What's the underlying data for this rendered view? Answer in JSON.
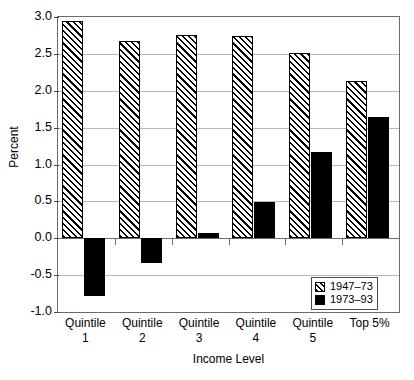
{
  "chart_data": {
    "type": "bar",
    "title": "",
    "xlabel": "Income Level",
    "ylabel": "Percent",
    "categories": [
      "Quintile 1",
      "Quintile 2",
      "Quintile 3",
      "Quintile 4",
      "Quintile 5",
      "Top 5%"
    ],
    "category_lines": [
      [
        "Quintile",
        "1"
      ],
      [
        "Quintile",
        "2"
      ],
      [
        "Quintile",
        "3"
      ],
      [
        "Quintile",
        "4"
      ],
      [
        "Quintile",
        "5"
      ],
      [
        "Top 5%",
        ""
      ]
    ],
    "series": [
      {
        "name": "1947–73",
        "style": "hatched",
        "values": [
          2.95,
          2.67,
          2.76,
          2.74,
          2.51,
          2.13
        ]
      },
      {
        "name": "1973–93",
        "style": "solid",
        "values": [
          -0.78,
          -0.34,
          0.07,
          0.49,
          1.17,
          1.65
        ]
      }
    ],
    "ylim": [
      -1.0,
      3.0
    ],
    "yticks": [
      3.0,
      2.5,
      2.0,
      1.5,
      1.0,
      0.5,
      0.0,
      -0.5,
      -1.0
    ],
    "ytick_labels": [
      "3.0",
      "2.5",
      "2.0",
      "1.5",
      "1.0",
      "0.5",
      "0.0",
      "-0.5",
      "-1.0"
    ],
    "grid": true,
    "legend_position": "bottom-right",
    "colors": {
      "series1": "#000000",
      "series2": "#000000",
      "grid": "#b9b9b9",
      "axis": "#6b6b6b"
    }
  }
}
